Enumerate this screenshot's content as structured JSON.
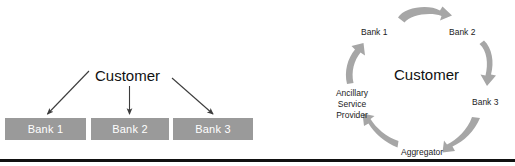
{
  "figure": {
    "colors": {
      "box_fill": "#9a9a9a",
      "box_text": "#ffffff",
      "arrow_gray": "#a6a6a6",
      "thin_arrow": "#3c3c3c",
      "rule": "#111111",
      "background": "#ffffff"
    }
  },
  "left_diagram": {
    "name": "direct-bank-relationships",
    "center_label": "Customer",
    "boxes": [
      {
        "label": "Bank 1"
      },
      {
        "label": "Bank 2"
      },
      {
        "label": "Bank 3"
      }
    ],
    "arrows": [
      {
        "name": "arrow-customer-to-bank-1",
        "from": "Customer",
        "to": "Bank 1"
      },
      {
        "name": "arrow-customer-to-bank-2",
        "from": "Customer",
        "to": "Bank 2"
      },
      {
        "name": "arrow-customer-to-bank-3",
        "from": "Customer",
        "to": "Bank 3"
      }
    ]
  },
  "right_diagram": {
    "name": "aggregator-cycle",
    "center_label": "Customer",
    "nodes": [
      {
        "name": "cycle-node-bank-1",
        "label": "Bank 1"
      },
      {
        "name": "cycle-node-bank-2",
        "label": "Bank 2"
      },
      {
        "name": "cycle-node-bank-3",
        "label": "Bank 3"
      },
      {
        "name": "cycle-node-aggregator",
        "label": "Aggregator"
      },
      {
        "name": "cycle-node-ancillary-service-provider",
        "label": "Ancillary Service Provider",
        "lines": [
          "Ancillary",
          "Service",
          "Provider"
        ]
      }
    ],
    "arrows": [
      {
        "name": "cycle-arrow-bank1-to-bank2",
        "direction": "right"
      },
      {
        "name": "cycle-arrow-bank2-to-bank3",
        "direction": "down"
      },
      {
        "name": "cycle-arrow-bank3-to-aggregator",
        "direction": "down-left"
      },
      {
        "name": "cycle-arrow-aggregator-to-asp",
        "direction": "up-left"
      },
      {
        "name": "cycle-arrow-asp-to-bank1",
        "direction": "up"
      }
    ]
  }
}
